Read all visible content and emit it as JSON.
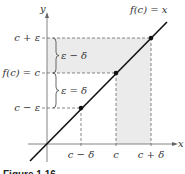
{
  "figure": {
    "function_label": "f(c) = x",
    "axes": {
      "x_label": "x",
      "y_label": "y"
    },
    "y_ticks": [
      "c + ε",
      "f(c) = c",
      "c − ε"
    ],
    "x_ticks": [
      "c − δ",
      "c",
      "c + δ"
    ],
    "brace_labels": {
      "upper": "ε − δ",
      "lower": "ε = δ"
    },
    "caption": "Figure 1.16",
    "colors": {
      "shade": "#ebebeb",
      "line": "#111111",
      "dash": "#555555"
    }
  }
}
